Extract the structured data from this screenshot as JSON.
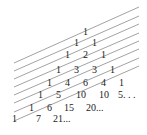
{
  "diagram": {
    "line_color": "#8a8a8a",
    "text_color": "#222222",
    "lines": [
      {
        "x1": 14,
        "y1": 63,
        "x2": 139,
        "y2": 7
      },
      {
        "x1": 14,
        "y1": 71,
        "x2": 139,
        "y2": 16
      },
      {
        "x1": 14,
        "y1": 79,
        "x2": 139,
        "y2": 24
      },
      {
        "x1": 14,
        "y1": 87,
        "x2": 139,
        "y2": 33
      },
      {
        "x1": 14,
        "y1": 95,
        "x2": 139,
        "y2": 41
      },
      {
        "x1": 14,
        "y1": 103,
        "x2": 139,
        "y2": 49
      },
      {
        "x1": 14,
        "y1": 112,
        "x2": 139,
        "y2": 58
      },
      {
        "x1": 14,
        "y1": 121,
        "x2": 139,
        "y2": 66
      }
    ],
    "rows": [
      {
        "y": 35,
        "cells": [
          {
            "x": 83,
            "t": "1"
          }
        ]
      },
      {
        "y": 46,
        "cells": [
          {
            "x": 74,
            "t": "1"
          },
          {
            "x": 92,
            "t": "1"
          }
        ]
      },
      {
        "y": 58,
        "cells": [
          {
            "x": 65,
            "t": "1"
          },
          {
            "x": 83,
            "t": "2"
          },
          {
            "x": 101,
            "t": "1"
          }
        ]
      },
      {
        "y": 73,
        "cells": [
          {
            "x": 56,
            "t": "1"
          },
          {
            "x": 74,
            "t": "3"
          },
          {
            "x": 92,
            "t": "3"
          },
          {
            "x": 110,
            "t": "1"
          }
        ]
      },
      {
        "y": 86,
        "cells": [
          {
            "x": 47,
            "t": "1"
          },
          {
            "x": 65,
            "t": "4"
          },
          {
            "x": 83,
            "t": "6"
          },
          {
            "x": 101,
            "t": "4"
          },
          {
            "x": 119,
            "t": "1"
          }
        ]
      },
      {
        "y": 98,
        "cells": [
          {
            "x": 38,
            "t": "1"
          },
          {
            "x": 56,
            "t": "5"
          },
          {
            "x": 76,
            "t": "10"
          },
          {
            "x": 99,
            "t": "10"
          },
          {
            "x": 118,
            "t": "5. . ."
          }
        ]
      },
      {
        "y": 111,
        "cells": [
          {
            "x": 29,
            "t": "1"
          },
          {
            "x": 47,
            "t": "6"
          },
          {
            "x": 64,
            "t": "15"
          },
          {
            "x": 86,
            "t": "20..."
          }
        ]
      },
      {
        "y": 122,
        "cells": [
          {
            "x": 12,
            "t": "1"
          },
          {
            "x": 36,
            "t": "7"
          },
          {
            "x": 53,
            "t": "21..."
          }
        ]
      }
    ]
  }
}
